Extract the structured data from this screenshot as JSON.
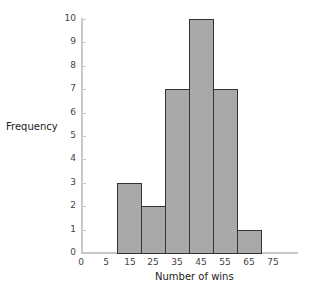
{
  "chart_data": {
    "type": "bar",
    "subtype": "histogram",
    "title": "",
    "xlabel": "Number of wins",
    "ylabel": "Frequency",
    "bins": [
      {
        "start": 10,
        "end": 20,
        "label": "15",
        "count": 3
      },
      {
        "start": 20,
        "end": 30,
        "label": "25",
        "count": 2
      },
      {
        "start": 30,
        "end": 40,
        "label": "35",
        "count": 7
      },
      {
        "start": 40,
        "end": 50,
        "label": "45",
        "count": 10
      },
      {
        "start": 50,
        "end": 60,
        "label": "55",
        "count": 7
      },
      {
        "start": 60,
        "end": 70,
        "label": "65",
        "count": 1
      }
    ],
    "categories": [
      "15",
      "25",
      "35",
      "45",
      "55",
      "65"
    ],
    "values": [
      3,
      2,
      7,
      10,
      7,
      1
    ],
    "x_tick_labels": [
      "0",
      "5",
      "15",
      "25",
      "35",
      "45",
      "55",
      "65",
      "75"
    ],
    "y_tick_labels": [
      "0",
      "1",
      "2",
      "3",
      "4",
      "5",
      "6",
      "7",
      "8",
      "9",
      "10"
    ],
    "ylim": [
      0,
      10
    ],
    "grid": false,
    "legend": null,
    "bar_color": "#a9a9a9",
    "bar_edge_color": "#333333"
  },
  "labels": {
    "xlabel": "Number of wins",
    "ylabel": "Frequency"
  }
}
